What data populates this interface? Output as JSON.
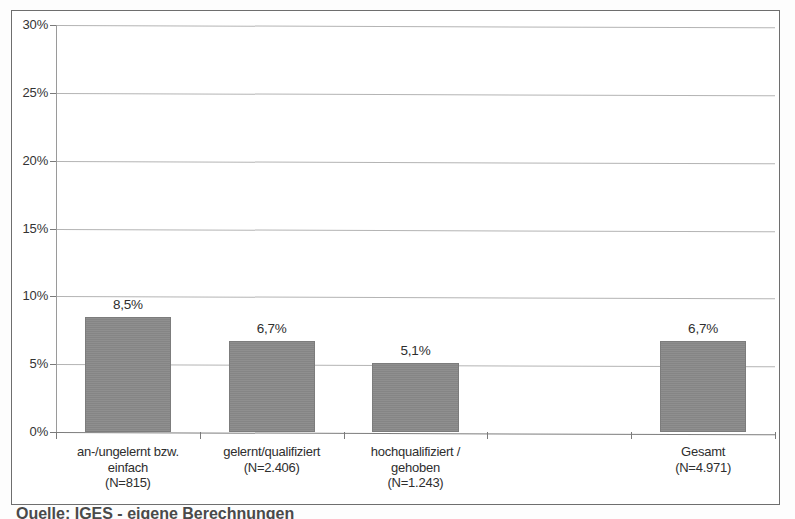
{
  "chart_data": {
    "type": "bar",
    "title": "",
    "subtitle": "",
    "xlabel": "",
    "ylabel": "",
    "ylim": [
      0,
      30
    ],
    "yunit": "%",
    "grid": true,
    "legend": "none",
    "decimal_separator": ",",
    "categories": [
      "an-/ungelernt bzw.\neinfach\n(N=815)",
      "gelernt/qualifiziert\n(N=2.406)",
      "hochqualifiziert /\ngehoben\n(N=1.243)",
      "",
      "Gesamt\n(N=4.971)"
    ],
    "values": [
      8.5,
      6.7,
      5.1,
      null,
      6.7
    ],
    "data_labels": [
      "8,5%",
      "6,7%",
      "5,1%",
      "",
      "6,7%"
    ],
    "y_ticks": [
      0,
      5,
      10,
      15,
      20,
      25,
      30
    ],
    "y_tick_labels": [
      "0%",
      "5%",
      "10%",
      "15%",
      "20%",
      "25%",
      "30%"
    ],
    "bar_color": "#8a8a8a",
    "gridline_color": "#b4b4b4",
    "axis_color": "#7a7a7a",
    "frame_color": "#6e6e6e"
  },
  "y_axis": {
    "ticks": [
      {
        "label": "30%",
        "value": 30
      },
      {
        "label": "25%",
        "value": 25
      },
      {
        "label": "20%",
        "value": 20
      },
      {
        "label": "15%",
        "value": 15
      },
      {
        "label": "10%",
        "value": 10
      },
      {
        "label": "5%",
        "value": 5
      },
      {
        "label": "0%",
        "value": 0
      }
    ]
  },
  "bars": [
    {
      "label": "8,5%",
      "category": "an-/ungelernt bzw.\neinfach\n(N=815)",
      "value": 8.5
    },
    {
      "label": "6,7%",
      "category": "gelernt/qualifiziert\n(N=2.406)",
      "value": 6.7
    },
    {
      "label": "5,1%",
      "category": "hochqualifiziert /\ngehoben\n(N=1.243)",
      "value": 5.1
    },
    {
      "label": "",
      "category": "",
      "value": null
    },
    {
      "label": "6,7%",
      "category": "Gesamt\n(N=4.971)",
      "value": 6.7
    }
  ],
  "caption": {
    "source_text": "Quelle: IGES - eigene Berechnungen"
  }
}
